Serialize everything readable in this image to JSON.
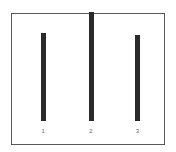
{
  "chart_data": {
    "type": "bar",
    "title": "",
    "subtitle": "",
    "xlabel": "",
    "ylabel": "",
    "categories": [
      "1",
      "2",
      "3"
    ],
    "values": [
      74,
      91,
      72
    ],
    "ylim": [
      0,
      109
    ],
    "grid": false,
    "legend": null,
    "orientation": "vertical",
    "bar_color": "#2a2a2a",
    "bar_width_px": 5,
    "frame": {
      "border_color": "#595959",
      "background": "#ffffff",
      "border_width_px": 1
    },
    "tick_label_color": "#666666",
    "bars": [
      {
        "category": "1",
        "value": 74,
        "center_pct": 20.5
      },
      {
        "category": "2",
        "value": 91,
        "center_pct": 52.0
      },
      {
        "category": "3",
        "value": 72,
        "center_pct": 82.5
      }
    ]
  },
  "figure": {
    "background": "#ffffff",
    "width_px": 176,
    "height_px": 152
  }
}
